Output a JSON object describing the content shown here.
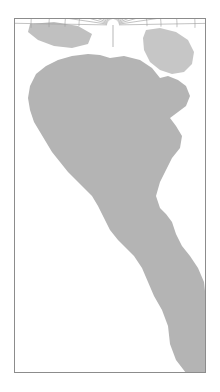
{
  "figure": {
    "kind": "tissot-indicatrix-map",
    "title": "",
    "caption": "",
    "background_color": "#ffffff"
  },
  "chart_data": {
    "type": "scatter",
    "title": "",
    "subtitle": "",
    "xlabel": "",
    "ylabel": "",
    "legend": [],
    "grid": true,
    "projection": {
      "name": "conic-polar",
      "pole_x": 113,
      "pole_y": 25,
      "meridian_count": 25,
      "parallel_count": 12
    },
    "frame": {
      "x": 14,
      "y": 18,
      "width": 192,
      "height": 355,
      "stroke": "#8c8c8c",
      "fill": "#ffffff",
      "stroke_width": 1
    },
    "colors": {
      "land_fill": "#b4b4b4",
      "land_fill_light": "#d2d2d2",
      "graticule": "#9a9a9a",
      "indicatrix_stroke_dark": "#2b2b2b",
      "indicatrix_stroke_light": "#5a5a5a",
      "frame": "#8c8c8c",
      "background": "#ffffff"
    },
    "indicatrix": {
      "tick_cross": true,
      "rows": [
        {
          "row": 1,
          "parallel_radius": 34,
          "count": 22,
          "circle_r": 4.0,
          "angle_start": 200,
          "angle_end": 340
        },
        {
          "row": 2,
          "parallel_radius": 48,
          "count": 20,
          "circle_r": 4.4,
          "angle_start": 196,
          "angle_end": 344
        },
        {
          "row": 3,
          "parallel_radius": 64,
          "count": 18,
          "circle_r": 4.8,
          "angle_start": 192,
          "angle_end": 348
        },
        {
          "row": 4,
          "parallel_radius": 82,
          "count": 16,
          "circle_r": 5.1,
          "angle_start": 190,
          "angle_end": 350
        },
        {
          "row": 5,
          "parallel_radius": 102,
          "count": 14,
          "circle_r": 5.4,
          "angle_start": 188,
          "angle_end": 352
        },
        {
          "row": 6,
          "parallel_radius": 124,
          "count": 12,
          "circle_r": 5.6,
          "angle_start": 186,
          "angle_end": 354
        },
        {
          "row": 7,
          "parallel_radius": 148,
          "count": 10,
          "circle_r": 5.8,
          "angle_start": 184,
          "angle_end": 356
        },
        {
          "row": 8,
          "parallel_radius": 176,
          "count": 9,
          "circle_r": 5.9,
          "angle_start": 183,
          "angle_end": 357
        },
        {
          "row": 9,
          "parallel_radius": 206,
          "count": 8,
          "circle_r": 6.0,
          "angle_start": 182,
          "angle_end": 358
        },
        {
          "row": 10,
          "parallel_radius": 240,
          "count": 7,
          "circle_r": 6.0,
          "angle_start": 182,
          "angle_end": 358
        },
        {
          "row": 11,
          "parallel_radius": 276,
          "count": 7,
          "circle_r": 6.1,
          "angle_start": 183,
          "angle_end": 357
        },
        {
          "row": 12,
          "parallel_radius": 315,
          "count": 7,
          "circle_r": 6.2,
          "angle_start": 184,
          "angle_end": 356
        }
      ],
      "total_circles": 150
    },
    "landmass": {
      "name": "north-america",
      "fill": "#b4b4b4",
      "outline_points": "110,58 124,56 140,60 152,68 160,78 168,76 178,80 186,86 190,96 186,106 178,112 170,118 176,126 182,136 180,148 172,158 166,170 160,182 156,196 160,208 166,214 172,222 176,234 182,246 190,256 198,268 204,282 206,300 206,340 206,373 186,373 176,360 170,344 168,326 162,310 154,296 148,282 142,268 134,256 126,248 118,240 110,230 104,218 98,206 92,196 84,188 76,180 68,172 60,162 52,152 46,142 40,132 34,122 30,110 28,98 30,86 36,74 46,66 58,60 72,56 88,54 100,55"
    },
    "landmass_secondary": {
      "name": "greenland-arctic",
      "fill": "#c6c6c6",
      "outline_points": "146,30 160,28 176,32 188,40 194,52 192,64 184,72 172,74 160,70 150,62 144,50 143,38"
    },
    "landmass_tertiary": {
      "name": "arctic-islands",
      "fill": "#c0c0c0",
      "outline_points": "30,24 54,22 78,26 92,34 88,44 72,48 54,46 38,40 28,32"
    }
  }
}
